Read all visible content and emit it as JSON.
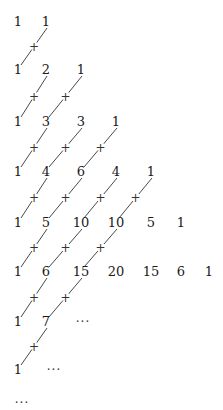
{
  "layout": {
    "row_y": [
      22,
      70,
      122,
      172,
      223,
      272,
      322,
      370,
      403
    ],
    "col_x": [
      18,
      46,
      81,
      116,
      151,
      181,
      209
    ]
  },
  "rows": [
    {
      "row": 0,
      "values": [
        "1",
        "1"
      ]
    },
    {
      "row": 1,
      "values": [
        "1",
        "2",
        "1"
      ]
    },
    {
      "row": 2,
      "values": [
        "1",
        "3",
        "3",
        "1"
      ]
    },
    {
      "row": 3,
      "values": [
        "1",
        "4",
        "6",
        "4",
        "1"
      ]
    },
    {
      "row": 4,
      "values": [
        "1",
        "5",
        "10",
        "10",
        "5",
        "1"
      ]
    },
    {
      "row": 5,
      "values": [
        "1",
        "6",
        "15",
        "20",
        "15",
        "6",
        "1"
      ]
    },
    {
      "row": 6,
      "values": [
        "1",
        "7",
        "..."
      ]
    },
    {
      "row": 7,
      "values": [
        "1",
        "..."
      ]
    },
    {
      "row": 8,
      "values": [
        "..."
      ]
    }
  ],
  "plus_symbol": "+",
  "ellipsis": "...",
  "connectors": [
    {
      "from_row": 0,
      "count": 1
    },
    {
      "from_row": 1,
      "count": 2
    },
    {
      "from_row": 2,
      "count": 3
    },
    {
      "from_row": 3,
      "count": 4
    },
    {
      "from_row": 4,
      "count": 3
    },
    {
      "from_row": 5,
      "count": 2
    },
    {
      "from_row": 6,
      "count": 1
    }
  ],
  "colors": {
    "text": "#1a1a1a",
    "line": "#333333",
    "background": "#ffffff"
  }
}
